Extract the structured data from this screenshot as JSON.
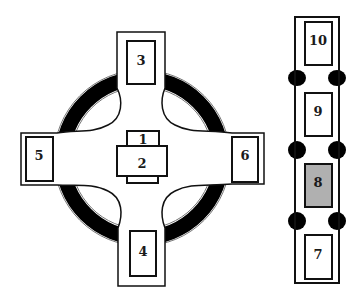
{
  "diagram": {
    "colors": {
      "ring": "#000000",
      "highlight": "#b0b0b0",
      "stroke": "#111111",
      "background": "#ffffff"
    },
    "cross": {
      "ring": {
        "cx": 142,
        "cy": 158,
        "outer_r": 87,
        "inner_r": 72
      },
      "center_boxes": [
        {
          "id": "1",
          "label": "1"
        },
        {
          "id": "2",
          "label": "2"
        }
      ],
      "arm_boxes": [
        {
          "id": "3",
          "label": "3",
          "position": "top"
        },
        {
          "id": "4",
          "label": "4",
          "position": "bottom"
        },
        {
          "id": "5",
          "label": "5",
          "position": "left"
        },
        {
          "id": "6",
          "label": "6",
          "position": "right"
        }
      ]
    },
    "column": {
      "boxes": [
        {
          "id": "10",
          "label": "10",
          "highlighted": false
        },
        {
          "id": "9",
          "label": "9",
          "highlighted": false
        },
        {
          "id": "8",
          "label": "8",
          "highlighted": true
        },
        {
          "id": "7",
          "label": "7",
          "highlighted": false
        }
      ],
      "separators": 3
    }
  }
}
